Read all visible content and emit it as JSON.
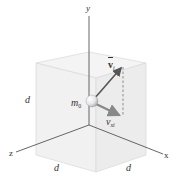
{
  "diagram": {
    "axes": {
      "y": {
        "label": "y"
      },
      "x": {
        "label": "x"
      },
      "z": {
        "label": "z"
      }
    },
    "cube": {
      "side_labels": {
        "vertical": "d",
        "front_left": "d",
        "front_right": "d"
      }
    },
    "particle": {
      "label_main": "m",
      "label_sub": "0"
    },
    "vectors": {
      "initial_velocity": {
        "main": "v",
        "sub": "i"
      },
      "x_component": {
        "main": "v",
        "sub": "xi"
      }
    },
    "colors": {
      "axis": "#555555",
      "cube_face": "#f0f0f0",
      "cube_edge": "#d8d8d8",
      "vector": "#555555",
      "component_arrow": "#888888",
      "dashed": "#777777"
    }
  }
}
